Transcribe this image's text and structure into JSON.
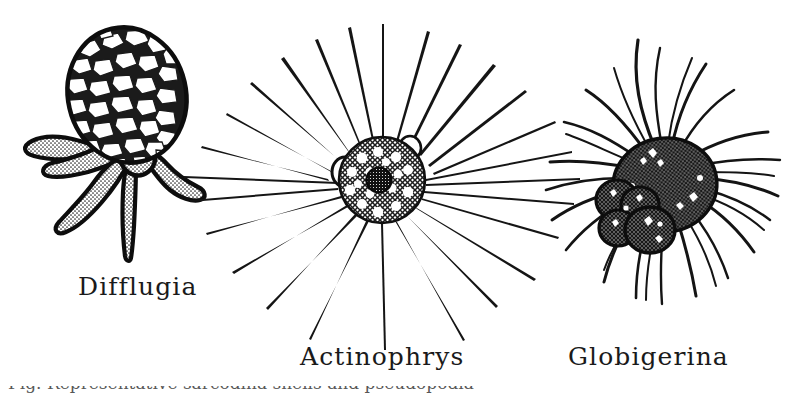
{
  "plate": {
    "background_color": "#ffffff",
    "ink_color": "#111111",
    "width": 808,
    "height": 393,
    "caption_clipped_text": "Fig. Representative sarcodina shells and pseudopodia"
  },
  "specimens": [
    {
      "id": "difflugia",
      "label": "Difflugia",
      "description": "testate amoeba with agglutinated sand-grain shell and lobose pseudopodia",
      "position": "left"
    },
    {
      "id": "actinophrys",
      "label": "Actinophrys",
      "description": "sun animalcule with spherical vacuolated body and straight radiating axopodia",
      "position": "center"
    },
    {
      "id": "globigerina",
      "label": "Globigerina",
      "description": "multi-chambered foraminiferan test with wavy filose pseudopodia",
      "position": "right"
    }
  ]
}
